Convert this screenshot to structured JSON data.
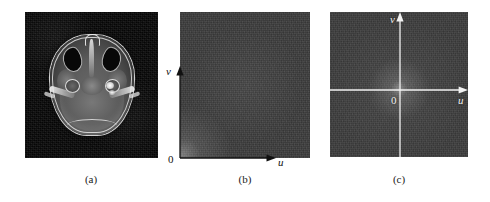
{
  "figure": {
    "panels": [
      {
        "id": "a",
        "caption": "(a)",
        "content_type": "mri-axial-slice",
        "description": "Axial MRI brain slice on black background",
        "axes": []
      },
      {
        "id": "b",
        "caption": "(b)",
        "content_type": "fourier-spectrum",
        "description": "Fourier spectrum with origin at lower-left corner",
        "axes": [
          {
            "name": "u",
            "label": "u",
            "direction": "right"
          },
          {
            "name": "v",
            "label": "v",
            "direction": "up"
          }
        ],
        "origin_label": "0",
        "origin_position": "bottom-left"
      },
      {
        "id": "c",
        "caption": "(c)",
        "content_type": "fourier-spectrum-centered",
        "description": "Centered Fourier spectrum with crosshair axes through the middle",
        "axes": [
          {
            "name": "u",
            "label": "u",
            "direction": "right"
          },
          {
            "name": "v",
            "label": "v",
            "direction": "up"
          }
        ],
        "origin_label": "0",
        "origin_position": "center"
      }
    ]
  },
  "colors": {
    "page_background": "#ffffff",
    "mri_background": "#060606",
    "spectrum_gray": "#3c3c3c",
    "axis_dark": "#111111",
    "axis_light": "#f2f2f2",
    "caption_text": "#1a1a1a"
  }
}
